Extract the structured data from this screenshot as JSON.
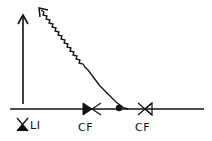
{
  "diagram": {
    "background": "#ffffff",
    "stroke_color": "#111111",
    "labels": {
      "level_indicator": "LI",
      "valve_left": "CF",
      "valve_right": "CF"
    },
    "elements": [
      {
        "type": "vertical-arrow",
        "direction": "up"
      },
      {
        "type": "wavy-arrow",
        "direction": "up-left"
      },
      {
        "type": "baseline"
      },
      {
        "type": "valve",
        "label": "CF",
        "style": "left-half-filled"
      },
      {
        "type": "junction-dot"
      },
      {
        "type": "valve",
        "label": "CF",
        "style": "open-with-triangle"
      },
      {
        "type": "level-indicator",
        "label": "LI",
        "style": "bottom-half-filled"
      }
    ]
  }
}
